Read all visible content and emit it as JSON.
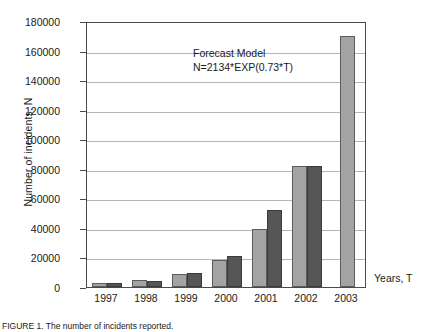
{
  "chart_data": {
    "type": "bar",
    "title": "",
    "xlabel": "Years, T",
    "ylabel": "Number of incidents, N",
    "categories": [
      "1997",
      "1998",
      "1999",
      "2000",
      "2001",
      "2002",
      "2003"
    ],
    "ylim": [
      0,
      180000
    ],
    "ytick_values": [
      0,
      20000,
      40000,
      60000,
      80000,
      100000,
      120000,
      140000,
      160000,
      180000
    ],
    "ytick_labels": [
      "0",
      "20000",
      "40000",
      "60000",
      "80000",
      "100000",
      "120000",
      "140000",
      "160000",
      "180000"
    ],
    "grid": true,
    "legend_position": "none",
    "series": [
      {
        "name": "Actual",
        "color": "#a3a3a3",
        "values": [
          2500,
          4500,
          8800,
          18000,
          39000,
          82000,
          170000
        ]
      },
      {
        "name": "Forecast",
        "color": "#565656",
        "values": [
          2400,
          4000,
          9300,
          21000,
          52000,
          82000,
          null
        ]
      }
    ],
    "annotations": [
      {
        "name": "forecast-model-annotation",
        "line1": "Forecast Model",
        "line2": "N=2134*EXP(0.73*T)"
      }
    ]
  },
  "axis": {
    "y_title": "Number of incidents, N",
    "x_title": "Years, T"
  },
  "annotation": {
    "line1": "Forecast Model",
    "line2": "N=2134*EXP(0.73*T)"
  },
  "caption": {
    "text": "FIGURE 1. The number of incidents reported."
  }
}
